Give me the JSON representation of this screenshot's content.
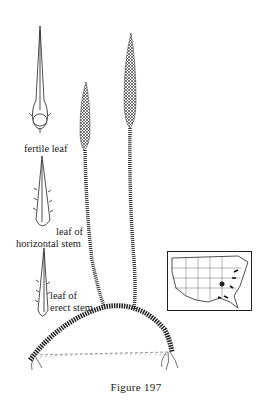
{
  "figure": {
    "caption": "Figure 197",
    "labels": {
      "fertile_leaf": "fertile leaf",
      "horizontal_stem_line1": "leaf of",
      "horizontal_stem_line2": "horizontal stem",
      "erect_stem_line1": "leaf of",
      "erect_stem_line2": "erect stem"
    },
    "illustration": {
      "subject": "club-moss plant with two erect fertile stems arising from an arching horizontal stem with roots",
      "leaf_details": [
        "fertile leaf",
        "leaf of horizontal stem",
        "leaf of erect stem"
      ]
    },
    "range_map": {
      "region": "United States",
      "marked_states": "eastern/southeastern coastal states and Tennessee area"
    },
    "colors": {
      "ink": "#1a1a1a",
      "background": "#ffffff"
    }
  }
}
